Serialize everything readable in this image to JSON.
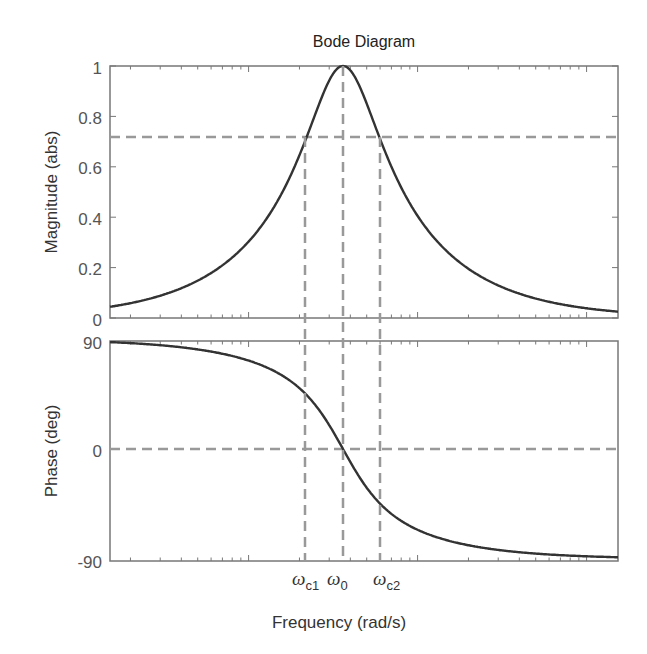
{
  "chart_data": [
    {
      "type": "line",
      "title": "Bode Diagram",
      "xlabel": "Frequency (rad/s)",
      "ylabel": "Magnitude (abs)",
      "xscale": "log",
      "ylim": [
        0,
        1
      ],
      "yticks": [
        "0",
        "0.2",
        "0.4",
        "0.6",
        "0.8",
        "1"
      ],
      "grid": false,
      "series": [
        {
          "name": "magnitude",
          "description": "Band-pass resonance peak, magnitude 1 at omega_0, ~0.03 at the ends",
          "color": "#333333"
        }
      ],
      "reference_lines": [
        {
          "orientation": "horizontal",
          "value": 0.707,
          "style": "dashed"
        },
        {
          "orientation": "vertical",
          "at": "omega_c1",
          "style": "dashed"
        },
        {
          "orientation": "vertical",
          "at": "omega_0",
          "style": "dashed"
        },
        {
          "orientation": "vertical",
          "at": "omega_c2",
          "style": "dashed"
        }
      ]
    },
    {
      "type": "line",
      "xlabel": "Frequency (rad/s)",
      "ylabel": "Phase (deg)",
      "xscale": "log",
      "ylim": [
        -90,
        90
      ],
      "yticks": [
        "-90",
        "0",
        "90"
      ],
      "grid": false,
      "series": [
        {
          "name": "phase",
          "description": "Phase falls from +90 deg to -90 deg, crossing 0 at omega_0, ~45 at omega_c1 and ~-45 at omega_c2",
          "color": "#333333"
        }
      ],
      "reference_lines": [
        {
          "orientation": "horizontal",
          "value": 0,
          "style": "dashed"
        },
        {
          "orientation": "vertical",
          "at": "omega_c1",
          "style": "dashed"
        },
        {
          "orientation": "vertical",
          "at": "omega_0",
          "style": "dashed"
        },
        {
          "orientation": "vertical",
          "at": "omega_c2",
          "style": "dashed"
        }
      ],
      "x_annotations": [
        "ωc1",
        "ω0",
        "ωc2"
      ]
    }
  ],
  "title": "Bode Diagram",
  "magnitude_axis": {
    "label": "Magnitude (abs)",
    "ticks": [
      "0",
      "0.2",
      "0.4",
      "0.6",
      "0.8",
      "1"
    ]
  },
  "phase_axis": {
    "label": "Phase (deg)",
    "ticks": [
      "90",
      "0",
      "-90"
    ]
  },
  "x_axis": {
    "label": "Frequency (rad/s)",
    "markers": [
      {
        "base": "ω",
        "sub": "c1"
      },
      {
        "base": "ω",
        "sub": "0"
      },
      {
        "base": "ω",
        "sub": "c2"
      }
    ]
  },
  "colors": {
    "curve": "#333333",
    "dashed": "#999999",
    "axes": "#777777"
  },
  "model": {
    "Q": 0.94,
    "center_px": 343,
    "px_per_decade": 169
  }
}
